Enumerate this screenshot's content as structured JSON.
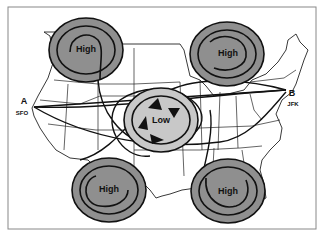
{
  "figure": {
    "pressure_systems": [
      {
        "id": "high-nw",
        "label": "High",
        "cx": 86,
        "cy": 50,
        "rx": 37,
        "ry": 32
      },
      {
        "id": "high-ne",
        "label": "High",
        "cx": 227,
        "cy": 54,
        "rx": 37,
        "ry": 32
      },
      {
        "id": "low-center",
        "label": "Low",
        "cx": 161,
        "cy": 120,
        "rx": 37,
        "ry": 32
      },
      {
        "id": "high-sw",
        "label": "High",
        "cx": 109,
        "cy": 190,
        "rx": 37,
        "ry": 32
      },
      {
        "id": "high-se",
        "label": "High",
        "cx": 228,
        "cy": 191,
        "rx": 37,
        "ry": 32
      }
    ],
    "endpoints": [
      {
        "id": "a",
        "letter": "A",
        "code": "SFO"
      },
      {
        "id": "b",
        "letter": "B",
        "code": "JFK"
      }
    ],
    "colors": {
      "high_fill": "#8f8f8f",
      "low_fill": "#c8c8c8",
      "stroke": "#111111",
      "map_line": "#222222"
    }
  }
}
